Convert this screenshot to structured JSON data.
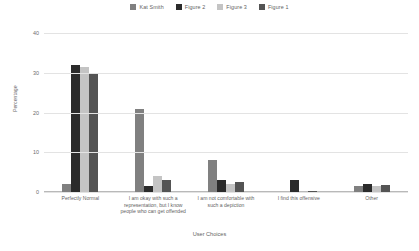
{
  "chart_data": {
    "type": "bar",
    "title": "",
    "xlabel": "User Choices",
    "ylabel": "Percentage",
    "ylim": [
      0,
      40
    ],
    "yticks": [
      0,
      10,
      20,
      30,
      40
    ],
    "grid": true,
    "legend_position": "top-center",
    "categories": [
      "Perfectly Normal",
      "I am okay with such a representation, but I know people who can get offended",
      "I am not comfortable with such a depiction",
      "I find this offensive",
      "Other"
    ],
    "series": [
      {
        "name": "Kat Smith",
        "color": "#808080",
        "values": [
          2,
          21,
          8,
          0,
          1.5
        ]
      },
      {
        "name": "Figure 2",
        "color": "#2b2b2b",
        "values": [
          32,
          1.5,
          3,
          3,
          2
        ]
      },
      {
        "name": "Figure 3",
        "color": "#c4c4c4",
        "values": [
          31.5,
          4,
          2,
          0,
          1.5
        ]
      },
      {
        "name": "Figure 1",
        "color": "#545454",
        "values": [
          30,
          3,
          2.5,
          0.3,
          1.8
        ]
      }
    ]
  }
}
